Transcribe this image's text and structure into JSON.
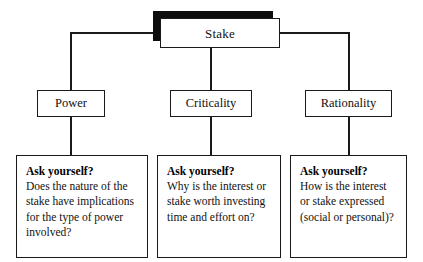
{
  "diagram": {
    "type": "hierarchy-tree",
    "root": {
      "label": "Stake",
      "style": "drop-shadow-box"
    },
    "branches": [
      {
        "id": "power",
        "category": "Power",
        "question_heading": "Ask yourself?",
        "question_body": "Does the nature of the stake have implications for the type of power involved?"
      },
      {
        "id": "criticality",
        "category": "Criticality",
        "question_heading": "Ask yourself?",
        "question_body": "Why is the interest or stake worth investing time and effort on?"
      },
      {
        "id": "rationality",
        "category": "Rationality",
        "question_heading": "Ask yourself?",
        "question_body": "How is the interest or stake expressed (social or personal)?"
      }
    ],
    "colors": {
      "line": "#1a1a1a",
      "box_fill": "#ffffff",
      "shadow": "#0d0d0d",
      "text": "#111111"
    }
  }
}
